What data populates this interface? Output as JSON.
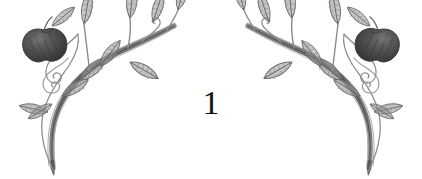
{
  "document": {
    "kind": "scanned-book-page-decoration",
    "background_color": "#ffffff",
    "page_number": "1"
  },
  "ornaments": [
    {
      "id": "ornament-left",
      "name": "floral-vine-corner-left",
      "orientation": "upright",
      "description": "Hand-drawn pencil vine sweeping from lower-left up to upper-right, bearing pointed leaves, curling tendrils and one shaded apple.",
      "ink_color": "#6f6f6f",
      "fruit_color": "#4a4a4a",
      "leaf_count": 11,
      "fruit_count": 1,
      "tendril_count": 3
    },
    {
      "id": "ornament-right",
      "name": "floral-vine-corner-right",
      "orientation": "mirrored",
      "description": "Horizontally mirrored copy of the left vine ornament.",
      "ink_color": "#6f6f6f",
      "fruit_color": "#4a4a4a",
      "leaf_count": 11,
      "fruit_count": 1,
      "tendril_count": 3
    }
  ],
  "colors": {
    "ink": "#6f6f6f",
    "ink_light": "#9a9a9a",
    "ink_dark": "#555555",
    "fruit_fill": "#4a4a4a",
    "fruit_shade": "#383838",
    "fruit_highlight": "#6b6b6b",
    "page_number_color": "#141414",
    "paper": "#ffffff"
  }
}
